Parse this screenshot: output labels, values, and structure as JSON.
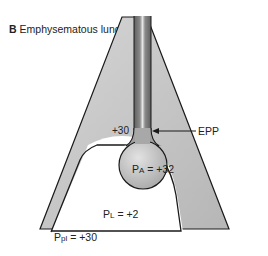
{
  "title": {
    "panel_letter": "B",
    "text": "Emphysematous lung"
  },
  "labels": {
    "airway_pressure": "+30",
    "epp": "EPP",
    "alveolar_pressure_symbol": "P",
    "alveolar_pressure_sub": "A",
    "alveolar_pressure_value": " = +32",
    "lung_pressure_symbol": "P",
    "lung_pressure_sub": "L",
    "lung_pressure_value": " = +2",
    "pleural_pressure_symbol": "P",
    "pleural_pressure_sub": "pl",
    "pleural_pressure_value": " = +30"
  },
  "colors": {
    "chest_wall_fill": "#c4c4c4",
    "outline": "#1a1a1a",
    "airway_dark": "#6e6e6e",
    "airway_light": "#d8d8d8",
    "alveolus_fill": "#bdbdbd",
    "pleural_space": "#ffffff"
  }
}
